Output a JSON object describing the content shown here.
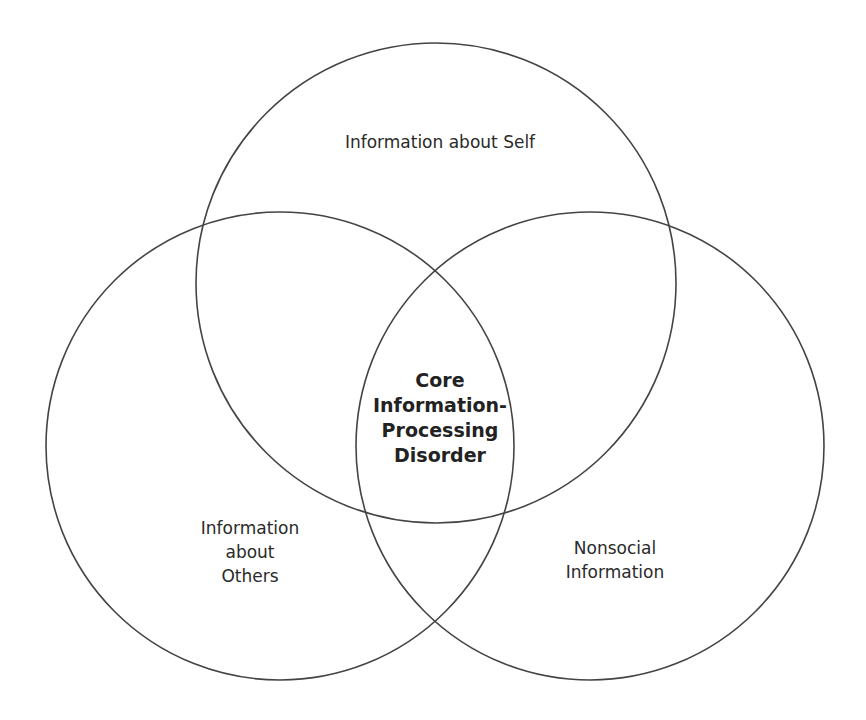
{
  "diagram": {
    "type": "venn",
    "stroke_color": "#444444",
    "background": "#ffffff",
    "circles": [
      {
        "id": "self",
        "cx": 436,
        "cy": 283,
        "r": 240
      },
      {
        "id": "others",
        "cx": 280,
        "cy": 446,
        "r": 234
      },
      {
        "id": "nonsocial",
        "cx": 590,
        "cy": 446,
        "r": 234
      }
    ],
    "labels": {
      "self": {
        "lines": [
          "Information about Self"
        ]
      },
      "others": {
        "lines": [
          "Information",
          "about",
          "Others"
        ]
      },
      "nonsocial": {
        "lines": [
          "Nonsocial",
          "Information"
        ]
      },
      "core": {
        "lines": [
          "Core",
          "Information-",
          "Processing",
          "Disorder"
        ]
      }
    }
  }
}
